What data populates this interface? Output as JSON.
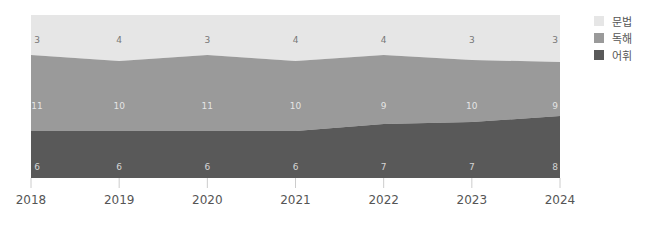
{
  "chart_data": {
    "type": "area",
    "stacked": true,
    "title": "",
    "xlabel": "",
    "ylabel": "",
    "categories": [
      "2018",
      "2019",
      "2020",
      "2021",
      "2022",
      "2023",
      "2024"
    ],
    "series": [
      {
        "name": "어휘",
        "color": "#595959",
        "values": [
          6,
          6,
          6,
          6,
          7,
          7,
          8
        ]
      },
      {
        "name": "독해",
        "color": "#9a9a9a",
        "values": [
          11,
          10,
          11,
          10,
          9,
          10,
          9
        ]
      },
      {
        "name": "문법",
        "color": "#e6e6e6",
        "values": [
          3,
          4,
          3,
          4,
          4,
          3,
          3
        ]
      }
    ],
    "grid": false,
    "legend_position": "right",
    "y_axis_visible": false
  },
  "legend": {
    "items": [
      {
        "label": "문법",
        "color": "#e6e6e6"
      },
      {
        "label": "독해",
        "color": "#9a9a9a"
      },
      {
        "label": "어휘",
        "color": "#595959"
      }
    ]
  },
  "layout": {
    "plot_left": 31,
    "plot_right": 560,
    "plot_top": 15,
    "plot_bottom": 178,
    "mid_top_px": [
      55,
      61,
      55,
      61,
      55,
      60,
      62
    ],
    "dark_top_px": [
      131,
      131,
      131,
      131,
      124,
      122,
      116
    ]
  }
}
